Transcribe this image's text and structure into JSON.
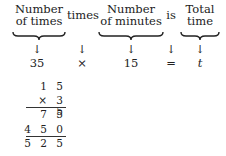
{
  "header_terms": [
    {
      "line1": "Number",
      "line2": "of times"
    },
    {
      "line1": "times",
      "line2": ""
    },
    {
      "line1": "Number",
      "line2": "of minutes"
    },
    {
      "line1": "is",
      "line2": ""
    },
    {
      "line1": "Total",
      "line2": "time"
    }
  ],
  "equation": {
    "values": [
      "35",
      "×",
      "15",
      "=",
      "t"
    ]
  },
  "multiplication": {
    "rows": [
      "1 5",
      "× 3 5",
      "7 5",
      "4 5 0",
      "5 2 5"
    ]
  }
}
